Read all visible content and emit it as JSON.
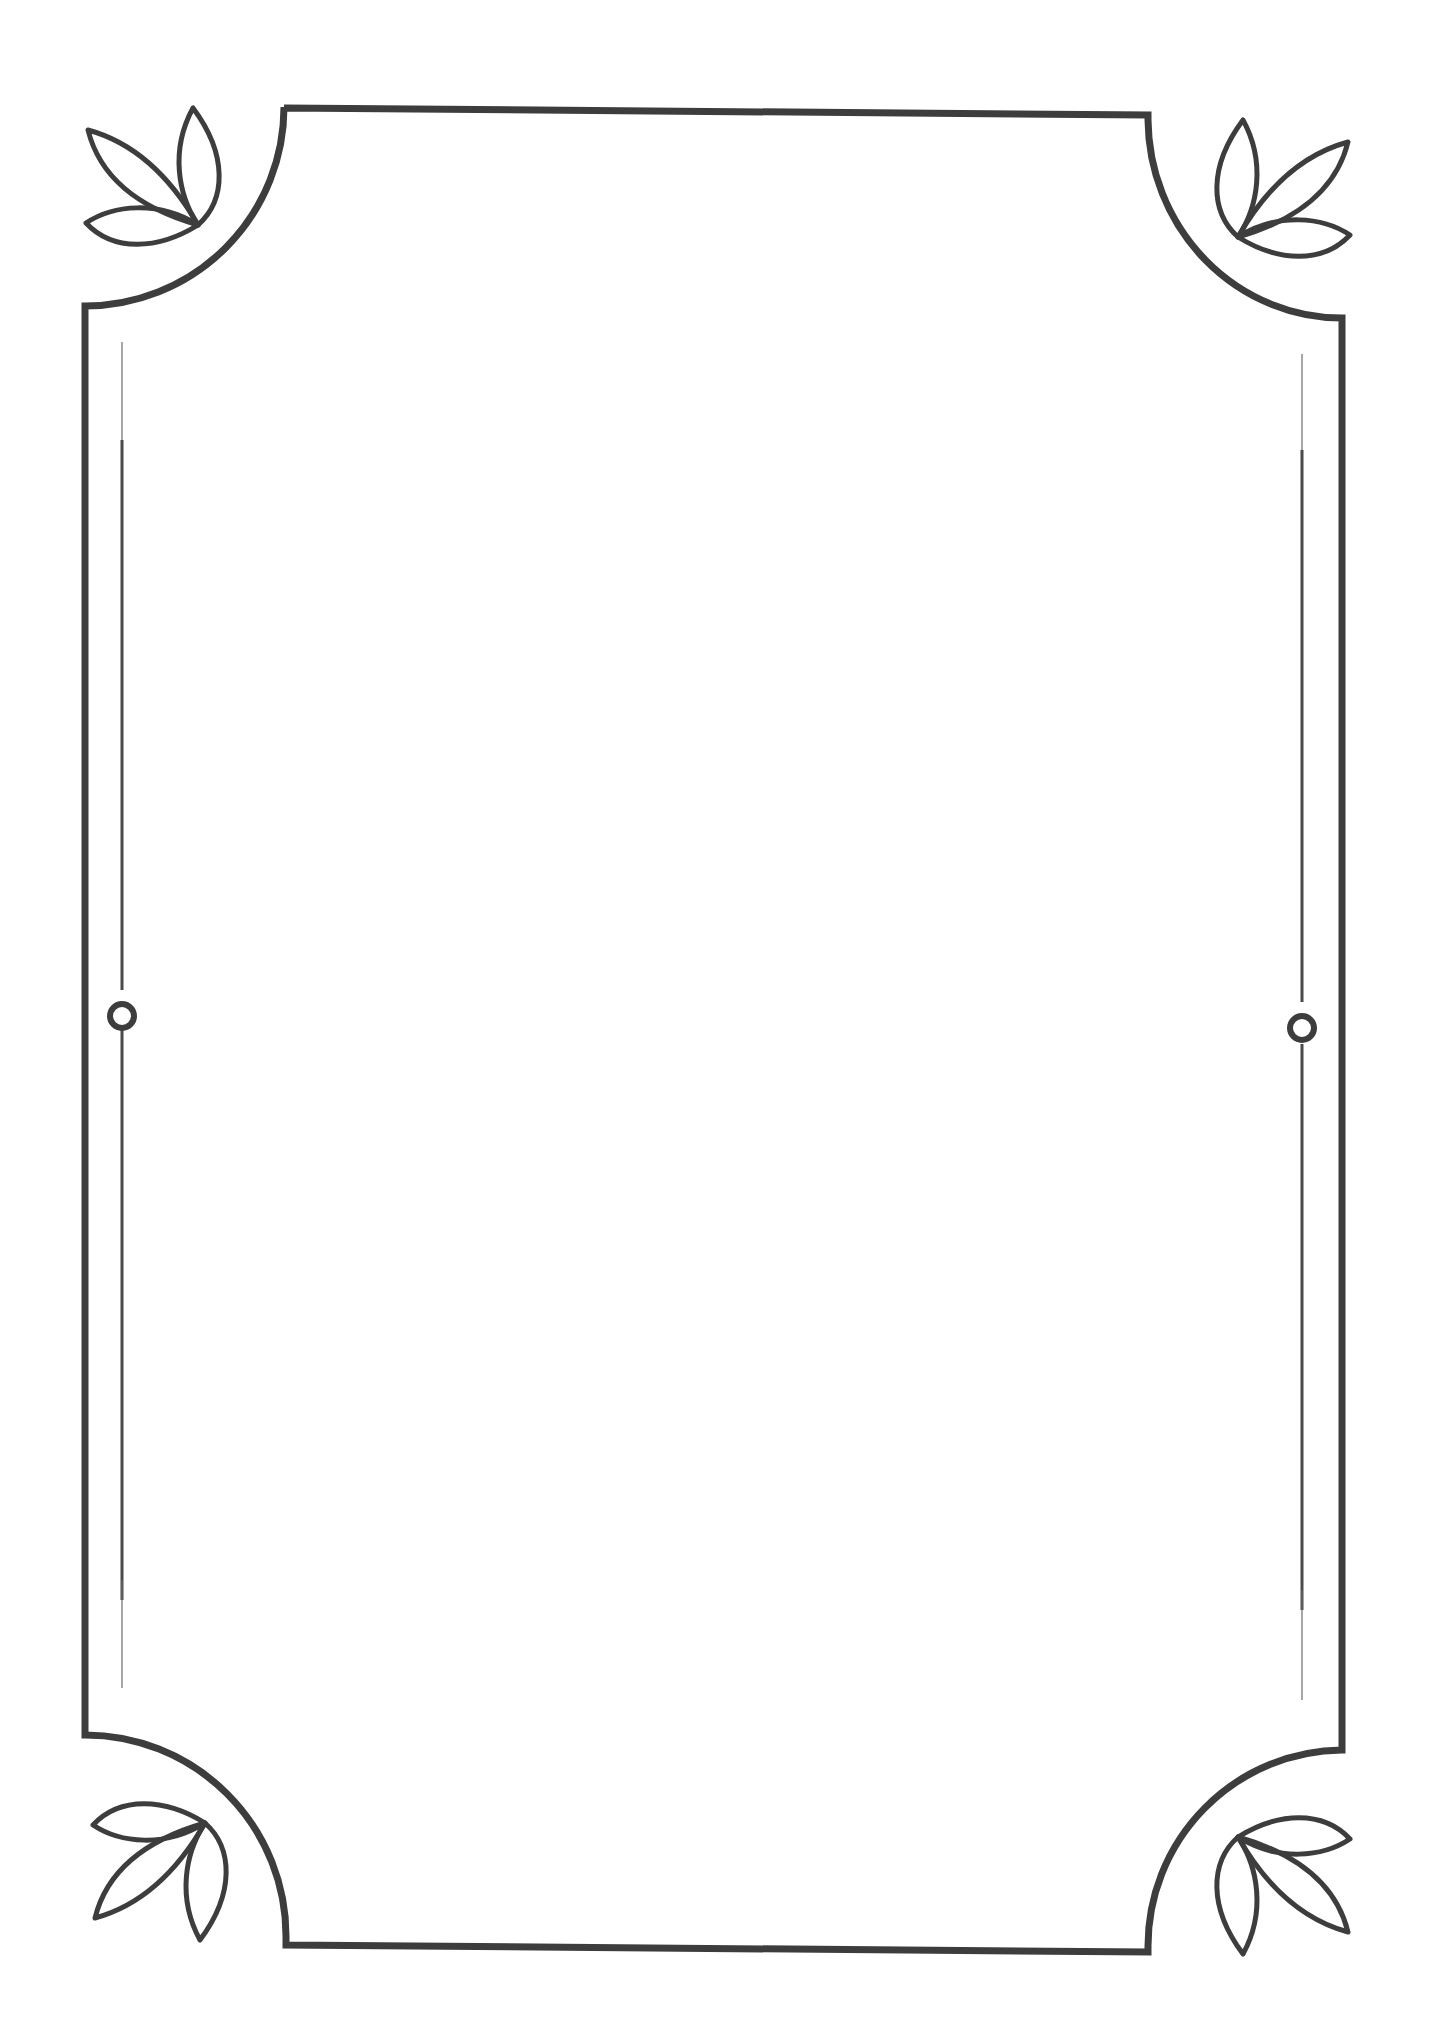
{
  "document": {
    "type": "decorative-page-border",
    "background_color": "#ffffff",
    "stroke_color": "#3d3d3d",
    "inner_line_color": "#4a4a4a",
    "content_text": ""
  },
  "frame": {
    "corners": [
      {
        "position": "top-left",
        "ornament": "three-leaf-sprig",
        "leaf_count": 3
      },
      {
        "position": "top-right",
        "ornament": "three-leaf-sprig",
        "leaf_count": 3
      },
      {
        "position": "bottom-left",
        "ornament": "three-leaf-sprig",
        "leaf_count": 3
      },
      {
        "position": "bottom-right",
        "ornament": "three-leaf-sprig",
        "leaf_count": 3
      }
    ],
    "side_rules": [
      {
        "side": "left",
        "ornament": "ring"
      },
      {
        "side": "right",
        "ornament": "ring"
      }
    ]
  }
}
